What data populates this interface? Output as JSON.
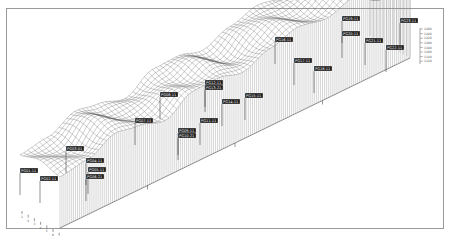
{
  "chart_data": {
    "type": "surface3d",
    "title": "",
    "xlabel": "",
    "ylabel": "",
    "zlabel": "",
    "grid": true,
    "legend_position": "right",
    "z_scale_ticks": [
      "1260",
      "1240",
      "1220",
      "1200",
      "1180",
      "1160",
      "1140",
      "1120"
    ],
    "profile": [
      {
        "x": 0.0,
        "z": 0.3
      },
      {
        "x": 0.08,
        "z": 0.38
      },
      {
        "x": 0.16,
        "z": 0.62
      },
      {
        "x": 0.22,
        "z": 0.55
      },
      {
        "x": 0.3,
        "z": 0.4
      },
      {
        "x": 0.38,
        "z": 0.7
      },
      {
        "x": 0.45,
        "z": 0.72
      },
      {
        "x": 0.52,
        "z": 0.6
      },
      {
        "x": 0.6,
        "z": 0.8
      },
      {
        "x": 0.68,
        "z": 0.95
      },
      {
        "x": 0.76,
        "z": 0.85
      },
      {
        "x": 0.84,
        "z": 1.0
      },
      {
        "x": 0.92,
        "z": 0.7
      },
      {
        "x": 1.0,
        "z": 0.75
      }
    ],
    "point_labels": [
      {
        "text": "PG01-11",
        "x": 20,
        "y": 168
      },
      {
        "text": "PG02-11",
        "x": 40,
        "y": 176
      },
      {
        "text": "PG03-01",
        "x": 66,
        "y": 146
      },
      {
        "text": "PG04-11",
        "x": 86,
        "y": 158
      },
      {
        "text": "PG05-11",
        "x": 88,
        "y": 167
      },
      {
        "text": "PG06-21",
        "x": 86,
        "y": 174
      },
      {
        "text": "PG07-11",
        "x": 135,
        "y": 118
      },
      {
        "text": "PG08-11",
        "x": 160,
        "y": 92
      },
      {
        "text": "PG09-11",
        "x": 178,
        "y": 128
      },
      {
        "text": "PG10-21",
        "x": 178,
        "y": 133
      },
      {
        "text": "PG11-11",
        "x": 200,
        "y": 118
      },
      {
        "text": "PG12-11",
        "x": 205,
        "y": 80
      },
      {
        "text": "PG13-21",
        "x": 205,
        "y": 85
      },
      {
        "text": "PG14-11",
        "x": 222,
        "y": 99
      },
      {
        "text": "PG15-11",
        "x": 245,
        "y": 93
      },
      {
        "text": "PG16-11",
        "x": 275,
        "y": 37
      },
      {
        "text": "PG17-11",
        "x": 294,
        "y": 58
      },
      {
        "text": "PG18-11",
        "x": 314,
        "y": 66
      },
      {
        "text": "PG19-11",
        "x": 342,
        "y": 16
      },
      {
        "text": "PG20-11",
        "x": 342,
        "y": 31
      },
      {
        "text": "PG21-11",
        "x": 365,
        "y": 38
      },
      {
        "text": "PG22-11",
        "x": 386,
        "y": 45
      },
      {
        "text": "PG23-11",
        "x": 400,
        "y": 18
      }
    ],
    "axis_ticks_front": [
      "1",
      "2",
      "3",
      "4",
      "5",
      "6",
      "7"
    ]
  }
}
